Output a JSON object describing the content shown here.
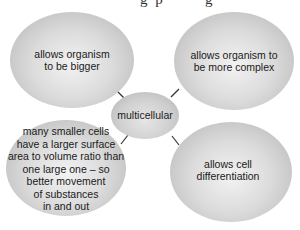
{
  "diagram": {
    "type": "spider-diagram",
    "center": {
      "label": "multicellular"
    },
    "branches": [
      {
        "position": "top-left",
        "label": "allows organism\nto be bigger"
      },
      {
        "position": "top-right",
        "label": "allows organism to\nbe more complex"
      },
      {
        "position": "bottom-left",
        "label": "many smaller cells\nhave a larger surface\narea to volume ratio than\none large one – so\nbetter movement\nof substances\nin and out"
      },
      {
        "position": "bottom-right",
        "label": "allows cell\ndifferentiation"
      }
    ],
    "colors": {
      "bubble_fill": "#d6d6d6",
      "connector": "#333333",
      "text": "#1a1a1a",
      "background": "#ffffff"
    }
  }
}
